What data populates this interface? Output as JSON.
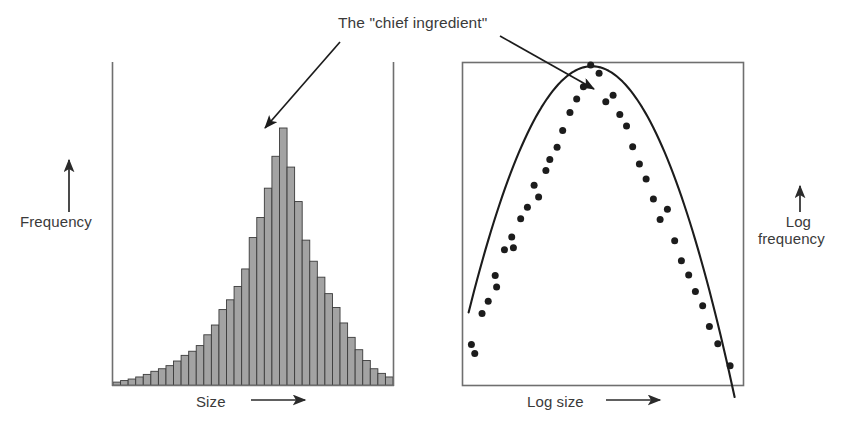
{
  "figure": {
    "annotation": {
      "text": "The \"chief ingredient\"",
      "leader_left_from": [
        340,
        42
      ],
      "leader_left_to": [
        265,
        128
      ],
      "leader_right_from": [
        500,
        36
      ],
      "leader_right_to": [
        594,
        89
      ]
    },
    "colors": {
      "bar_fill": "#a3a3a3",
      "bar_stroke": "#3b3b3b",
      "axis": "#6f6f6f",
      "ink": "#1c1c1c",
      "text": "#3a3a3a",
      "background": "#ffffff"
    }
  },
  "chart_data": [
    {
      "id": "left-histogram",
      "type": "bar",
      "title": "",
      "xlabel": "Size",
      "ylabel": "Frequency",
      "xlabel_arrow": true,
      "ylabel_arrow": true,
      "grid": false,
      "legend": "none",
      "axis_frame": "left-right-bottom",
      "ticks": [],
      "ylim": [
        0,
        100
      ],
      "categories": [
        1,
        2,
        3,
        4,
        5,
        6,
        7,
        8,
        9,
        10,
        11,
        12,
        13,
        14,
        15,
        16,
        17,
        18,
        19,
        20,
        21,
        22,
        23,
        24,
        25,
        26,
        27,
        28,
        29,
        30,
        31,
        32,
        33,
        34,
        35,
        36,
        37
      ],
      "values": [
        1.2,
        1.8,
        2.4,
        3.2,
        4.2,
        5.4,
        6.4,
        7.6,
        9.4,
        11.6,
        13.2,
        15.4,
        19.6,
        23.4,
        29.4,
        33.2,
        38.4,
        45.2,
        57.4,
        65.2,
        76.6,
        89.0,
        100.0,
        84.8,
        71.4,
        56.4,
        48.2,
        42.0,
        35.6,
        30.2,
        24.2,
        18.6,
        13.8,
        9.6,
        6.4,
        4.6,
        3.2
      ]
    },
    {
      "id": "right-scatter",
      "type": "scatter",
      "title": "",
      "xlabel": "Log size",
      "ylabel": "Log frequency",
      "xlabel_arrow": true,
      "ylabel_arrow": true,
      "grid": false,
      "legend": "none",
      "axis_frame": "box",
      "ticks": [],
      "xlim": [
        0,
        100
      ],
      "ylim": [
        0,
        100
      ],
      "fit_curve": {
        "shape": "inverted-parabola",
        "peak_x": 46.0,
        "peak_y": 99.0,
        "curvature": 0.0395
      },
      "points_x": [
        3.0,
        4.2,
        6.8,
        9.0,
        11.5,
        12.0,
        14.8,
        17.4,
        18.0,
        20.6,
        23.0,
        25.4,
        27.0,
        29.6,
        31.0,
        33.6,
        35.6,
        38.2,
        40.6,
        43.0,
        45.6,
        48.6,
        51.0,
        53.6,
        56.0,
        58.4,
        60.6,
        63.0,
        65.4,
        68.0,
        70.4,
        73.0,
        75.6,
        78.0,
        80.6,
        83.0,
        85.6,
        88.0,
        91.0,
        95.4
      ],
      "points_y": [
        12.6,
        9.8,
        22.2,
        26.0,
        34.0,
        30.4,
        42.0,
        46.0,
        42.6,
        51.6,
        55.2,
        62.0,
        58.4,
        66.6,
        70.0,
        73.8,
        79.0,
        84.6,
        88.8,
        92.6,
        99.4,
        96.8,
        88.0,
        90.0,
        84.0,
        80.4,
        74.0,
        68.6,
        64.0,
        57.8,
        51.4,
        54.6,
        44.8,
        38.6,
        34.2,
        29.0,
        24.6,
        18.2,
        12.8,
        6.0
      ]
    }
  ]
}
